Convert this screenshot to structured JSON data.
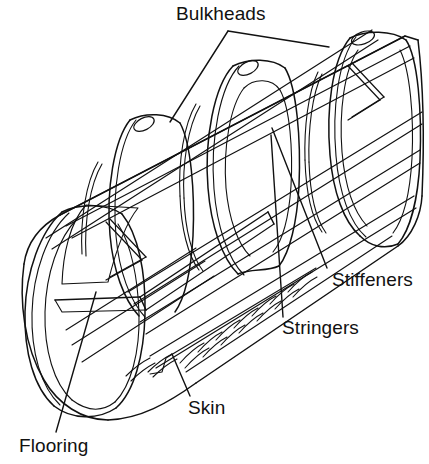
{
  "figure": {
    "background_color": "#ffffff",
    "line_color": "#111111"
  },
  "labels": {
    "bulkheads": "Bulkheads",
    "stiffeners": "Stiffeners",
    "stringers": "Stringers",
    "skin": "Skin",
    "flooring": "Flooring"
  }
}
